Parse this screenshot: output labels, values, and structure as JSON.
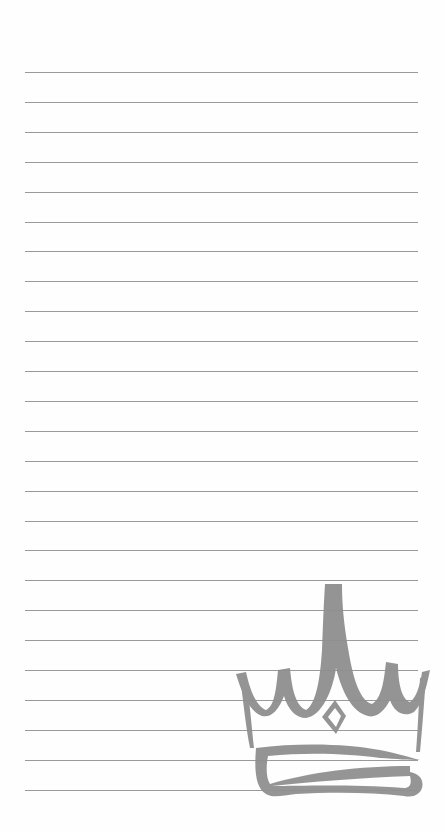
{
  "page": {
    "type": "lined-notepad",
    "background_color": "#ffffff",
    "rule_color": "#9a9a9a",
    "rule_count": 25,
    "rule_start_y": 72,
    "rule_spacing": 29.9,
    "rule_x_start": 25,
    "rule_x_end": 418
  },
  "decoration": {
    "icon": "crown-icon",
    "color": "#8f8f8f",
    "position": "bottom-right"
  }
}
